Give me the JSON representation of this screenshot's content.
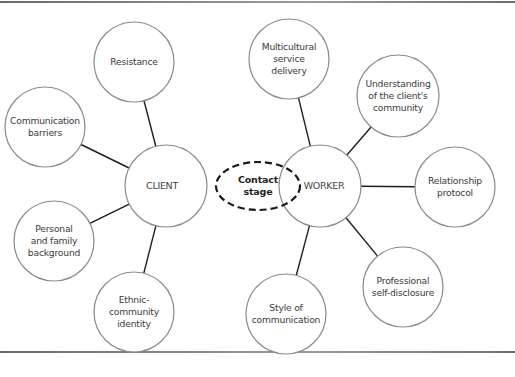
{
  "diagram": {
    "center": {
      "id": "contact-stage",
      "label": "Contact\nstage",
      "cx": 258,
      "cy": 186,
      "rx": 42,
      "ry": 24,
      "style": "dashed-ellipse"
    },
    "hubs": [
      {
        "id": "client",
        "label": "CLIENT",
        "cx": 166,
        "cy": 186,
        "r": 41
      },
      {
        "id": "worker",
        "label": "WORKER",
        "cx": 320,
        "cy": 186,
        "r": 41
      }
    ],
    "nodes": [
      {
        "id": "resistance",
        "hub": "client",
        "label": "Resistance",
        "cx": 134,
        "cy": 62,
        "r": 40
      },
      {
        "id": "communication-barriers",
        "hub": "client",
        "label": "Communication\nbarriers",
        "cx": 45,
        "cy": 127,
        "r": 40
      },
      {
        "id": "personal-family-background",
        "hub": "client",
        "label": "Personal\nand family\nbackground",
        "cx": 54,
        "cy": 241,
        "r": 40
      },
      {
        "id": "ethnic-community-identity",
        "hub": "client",
        "label": "Ethnic-\ncommunity\nidentity",
        "cx": 134,
        "cy": 312,
        "r": 40
      },
      {
        "id": "multicultural-service-delivery",
        "hub": "worker",
        "label": "Multicultural\nservice\ndelivery",
        "cx": 289,
        "cy": 59,
        "r": 40
      },
      {
        "id": "understanding-clients-community",
        "hub": "worker",
        "label": "Understanding\nof the client's\ncommunity",
        "cx": 398,
        "cy": 96,
        "r": 41
      },
      {
        "id": "relationship-protocol",
        "hub": "worker",
        "label": "Relationship\nprotocol",
        "cx": 455,
        "cy": 187,
        "r": 40
      },
      {
        "id": "professional-self-disclosure",
        "hub": "worker",
        "label": "Professional\nself-disclosure",
        "cx": 403,
        "cy": 287,
        "r": 40
      },
      {
        "id": "style-of-communication",
        "hub": "worker",
        "label": "Style of\ncommunication",
        "cx": 286,
        "cy": 314,
        "r": 40
      }
    ],
    "colors": {
      "circle_stroke": "#8a8a8a",
      "connector": "#1e1e1e",
      "dashed_ellipse": "#1a1a1a",
      "text": "#3a3a3a",
      "background": "#ffffff"
    }
  }
}
